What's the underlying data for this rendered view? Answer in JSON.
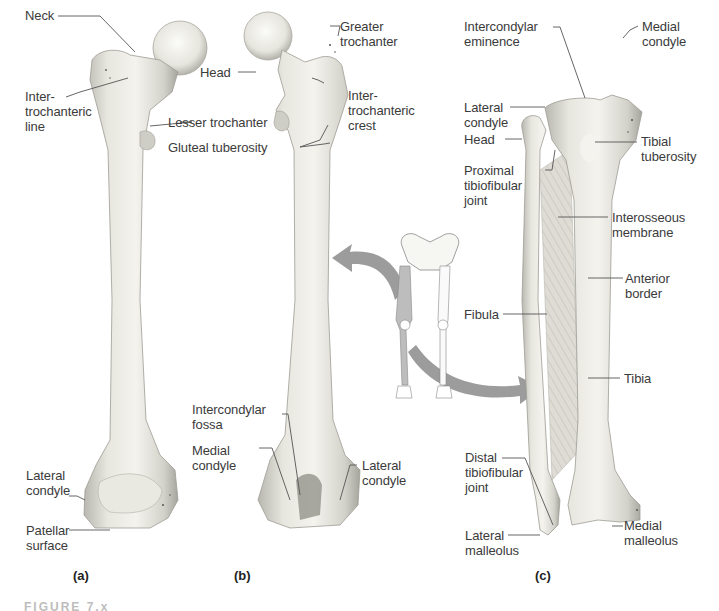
{
  "figure": {
    "panels": [
      {
        "id": "a",
        "marker": "(a)",
        "bone": "femur-anterior",
        "labels": {
          "neck": "Neck",
          "intertrochanteric_line": "Inter-\ntrochanteric\nline",
          "lateral_condyle": "Lateral\ncondyle",
          "patellar_surface": "Patellar\nsurface"
        }
      },
      {
        "id": "b",
        "marker": "(b)",
        "bone": "femur-posterior",
        "labels": {
          "head": "Head",
          "lesser_trochanter": "Lesser trochanter",
          "gluteal_tuberosity": "Gluteal tuberosity",
          "greater_trochanter": "Greater\ntrochanter",
          "intertrochanteric_crest": "Inter-\ntrochanteric\ncrest",
          "intercondylar_fossa": "Intercondylar\nfossa",
          "medial_condyle": "Medial\ncondyle",
          "lateral_condyle": "Lateral\ncondyle"
        }
      },
      {
        "id": "c",
        "marker": "(c)",
        "bone": "tibia-fibula-anterior",
        "labels": {
          "intercondylar_eminence": "Intercondylar\neminence",
          "lateral_condyle": "Lateral\ncondyle",
          "head": "Head",
          "proximal_tibiofibular_joint": "Proximal\ntibiofibular\njoint",
          "medial_condyle": "Medial\ncondyle",
          "tibial_tuberosity": "Tibial\ntuberosity",
          "interosseous_membrane": "Interosseous\nmembrane",
          "anterior_border": "Anterior\nborder",
          "fibula": "Fibula",
          "tibia": "Tibia",
          "distal_tibiofibular_joint": "Distal\ntibiofibular\njoint",
          "lateral_malleolus": "Lateral\nmalleolus",
          "medial_malleolus": "Medial\nmalleolus"
        }
      }
    ],
    "inset": {
      "name": "lower-limb-skeleton-orientation",
      "arrow_color": "#9a9a9a"
    },
    "caption_partial": "FIGURE 7.x"
  },
  "colors": {
    "bone_light": "#f1f0ea",
    "bone_mid": "#d9d8d0",
    "bone_shadow": "#a9a8a0",
    "leader_line": "#555555",
    "arrow": "#9c9c9c"
  }
}
